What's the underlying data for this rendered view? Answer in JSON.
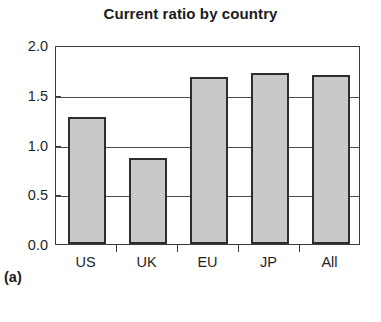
{
  "panel": {
    "caption": "(a)"
  },
  "chart_data": {
    "type": "bar",
    "title": "Current ratio by country",
    "xlabel": "",
    "ylabel": "",
    "categories": [
      "US",
      "UK",
      "EU",
      "JP",
      "All"
    ],
    "values": [
      1.28,
      0.86,
      1.68,
      1.72,
      1.7
    ],
    "ylim": [
      0.0,
      2.0
    ],
    "yticks": [
      0.0,
      0.5,
      1.0,
      1.5,
      2.0
    ],
    "ytick_labels": [
      "0.0",
      "0.5",
      "1.0",
      "1.5",
      "2.0"
    ],
    "grid": true,
    "grid_axis": "y",
    "legend": false,
    "legend_position": "none",
    "bar_fill_color": "#c9c9c9",
    "bar_edge_color": "#2d2d2d",
    "axis_color": "#3b3b3b",
    "background_color": "#ffffff"
  }
}
